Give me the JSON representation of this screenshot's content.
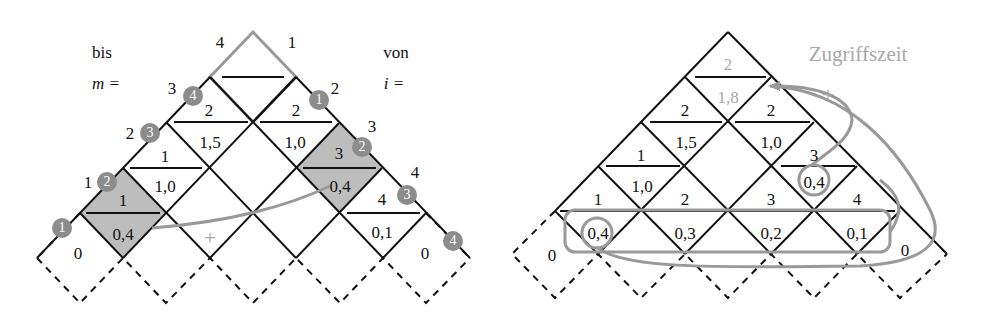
{
  "colors": {
    "line": "#111111",
    "highlight": "#999999",
    "shade": "#bdbdbd",
    "badge": "#8c8c8c",
    "gray_text": "#a8a8a8"
  },
  "left": {
    "header_left": {
      "line1": "bis",
      "line2": "m ="
    },
    "header_right": {
      "line1": "von",
      "line2": "i ="
    },
    "m_labels": [
      "1",
      "2",
      "3",
      "4"
    ],
    "i_labels": [
      "1",
      "2",
      "3",
      "4"
    ],
    "left_badges": [
      "1",
      "2",
      "3",
      "4"
    ],
    "right_badges": [
      "1",
      "2",
      "3",
      "4"
    ],
    "cells": [
      {
        "top": "1",
        "bottom": "0,4"
      },
      {
        "top": "1",
        "bottom": "1,0"
      },
      {
        "top": "2",
        "bottom": "1,5"
      },
      {
        "top": "2",
        "bottom": "1,0"
      },
      {
        "top": "3",
        "bottom": "0,4"
      },
      {
        "top": "4",
        "bottom": "0,1"
      }
    ],
    "zero_left": "0",
    "zero_right": "0",
    "plus": "+"
  },
  "right": {
    "annotation": "Zugriffszeit",
    "plus": "+",
    "cells": [
      {
        "top": "2",
        "bottom": "1,8"
      },
      {
        "top": "2",
        "bottom": "1,5"
      },
      {
        "top": "2",
        "bottom": "1,0"
      },
      {
        "top": "1",
        "bottom": "1,0"
      },
      {
        "top": "3",
        "bottom": "0,4"
      },
      {
        "top": "1",
        "bottom": "0,4"
      },
      {
        "top": "2",
        "bottom": "0,3"
      },
      {
        "top": "3",
        "bottom": "0,2"
      },
      {
        "top": "4",
        "bottom": "0,1"
      }
    ],
    "zero_left": "0",
    "zero_right": "0"
  }
}
